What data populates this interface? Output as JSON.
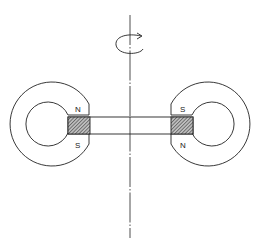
{
  "diagram": {
    "left_magnet": {
      "top_pole": "N",
      "bottom_pole": "S"
    },
    "right_magnet": {
      "top_pole": "S",
      "bottom_pole": "N"
    },
    "colors": {
      "stroke": "#222222",
      "hatch": "#555555",
      "background": "#ffffff"
    },
    "elements": [
      "rotation-axis",
      "rotation-arrow",
      "left-ring-magnet",
      "right-ring-magnet",
      "connecting-bar",
      "left-hatched-block",
      "right-hatched-block"
    ]
  }
}
